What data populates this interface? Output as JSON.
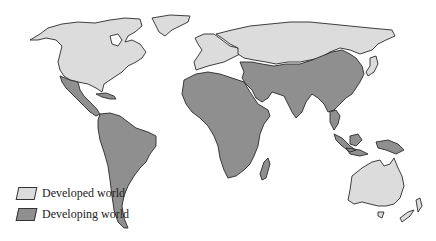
{
  "map": {
    "title": "World map: developed vs developing world",
    "colors": {
      "developed": "#dcdcdc",
      "developing": "#8f8f8f",
      "outline": "#2a2a2a",
      "background": "#ffffff"
    },
    "regions": [
      {
        "name": "North America (USA & Canada)",
        "category": "Developed world"
      },
      {
        "name": "Greenland",
        "category": "Developed world"
      },
      {
        "name": "Europe",
        "category": "Developed world"
      },
      {
        "name": "Russia / former USSR",
        "category": "Developed world"
      },
      {
        "name": "Japan",
        "category": "Developed world"
      },
      {
        "name": "Australia",
        "category": "Developed world"
      },
      {
        "name": "New Zealand",
        "category": "Developed world"
      },
      {
        "name": "Mexico & Central America",
        "category": "Developing world"
      },
      {
        "name": "Caribbean",
        "category": "Developing world"
      },
      {
        "name": "South America",
        "category": "Developing world"
      },
      {
        "name": "Africa",
        "category": "Developing world"
      },
      {
        "name": "Madagascar",
        "category": "Developing world"
      },
      {
        "name": "Middle East",
        "category": "Developing world"
      },
      {
        "name": "South Asia",
        "category": "Developing world"
      },
      {
        "name": "China & East Asia",
        "category": "Developing world"
      },
      {
        "name": "Southeast Asia & Indonesia",
        "category": "Developing world"
      },
      {
        "name": "New Guinea",
        "category": "Developing world"
      }
    ]
  },
  "legend": {
    "items": [
      {
        "label": "Developed world",
        "color": "#dcdcdc"
      },
      {
        "label": "Developing world",
        "color": "#8f8f8f"
      }
    ]
  }
}
